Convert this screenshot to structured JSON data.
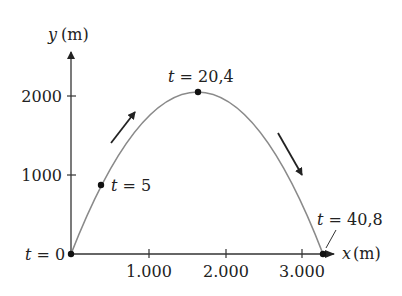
{
  "axes": {
    "y_label_var": "y",
    "y_label_unit": "(m)",
    "x_label_var": "x",
    "x_label_unit": "(m)",
    "y_ticks": [
      "1000",
      "2000"
    ],
    "x_ticks": [
      "1.000",
      "2.000",
      "3.000"
    ]
  },
  "points": [
    {
      "var": "t",
      "eq": " = 0",
      "x": 0,
      "y": 0
    },
    {
      "var": "t",
      "eq": " = 5",
      "x": 380,
      "y": 870
    },
    {
      "var": "t",
      "eq": " = 20,4",
      "x": 1650,
      "y": 2040
    },
    {
      "var": "t",
      "eq": " = 40,8",
      "x": 3300,
      "y": 0
    }
  ],
  "colors": {
    "curve": "#8a8a8a",
    "axis": "#333333",
    "arrow": "#222222",
    "point": "#111111"
  }
}
